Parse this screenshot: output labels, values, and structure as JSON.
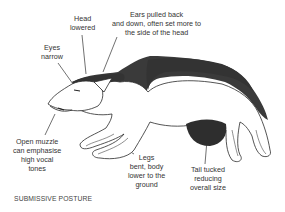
{
  "diagram": {
    "caption": "SUBMISSIVE POSTURE",
    "labels": {
      "head": {
        "line1": "Head",
        "line2": "lowered"
      },
      "ears": {
        "line1": "Ears pulled back",
        "line2": "and down, often set more to",
        "line3": "the side of the head"
      },
      "eyes": {
        "line1": "Eyes",
        "line2": "narrow"
      },
      "muzzle": {
        "line1": "Open muzzle",
        "line2": "can emphasise",
        "line3": "high vocal",
        "line4": "tones"
      },
      "legs": {
        "line1": "Legs",
        "line2": "bent, body",
        "line3": "lower to the",
        "line4": "ground"
      },
      "tail": {
        "line1": "Tail tucked",
        "line2": "reducing",
        "line3": "overall size"
      }
    },
    "colors": {
      "ink": "#2a2a2a",
      "fur_dark": "#3a3a3a",
      "text": "#333333",
      "background": "#ffffff"
    }
  }
}
